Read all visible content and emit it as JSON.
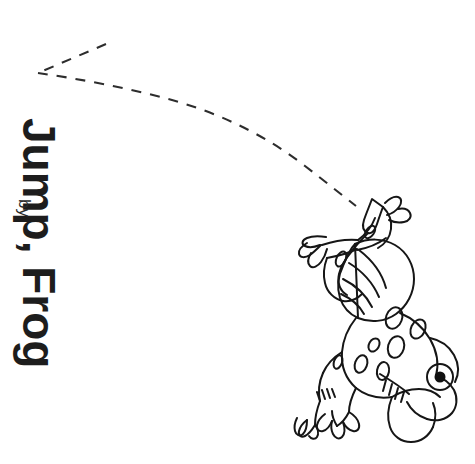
{
  "page": {
    "background_color": "#ffffff",
    "width": 475,
    "height": 464,
    "ink_color": "#1b1b1b"
  },
  "title": {
    "text": "Jump, Frog",
    "rotation_degrees": 90
  },
  "byline": {
    "text": "by",
    "rotation_degrees": 90
  },
  "author": {
    "text": ""
  },
  "illustration": {
    "subject": "frog-leaping",
    "style": "black-and-white-line-drawing",
    "orientation": "rotated-sideways",
    "features": [
      "striped-thighs",
      "spotted-back",
      "webbed-hind-feet",
      "front-hands-with-fingers",
      "round-eye-with-black-pupil"
    ]
  },
  "trajectory": {
    "name": "dashed-jump-arc",
    "style": "dashed",
    "dash_pattern": "10 9",
    "stroke_width": 2.1,
    "color": "#2d2d2d",
    "arrowhead_vertex": [
      38,
      73
    ],
    "arrowhead_upper_tip": [
      106,
      44
    ],
    "arc_points": [
      [
        38,
        73
      ],
      [
        70,
        77
      ],
      [
        110,
        84
      ],
      [
        150,
        93
      ],
      [
        195,
        107
      ],
      [
        240,
        126
      ],
      [
        280,
        150
      ],
      [
        318,
        177
      ],
      [
        352,
        205
      ]
    ]
  }
}
